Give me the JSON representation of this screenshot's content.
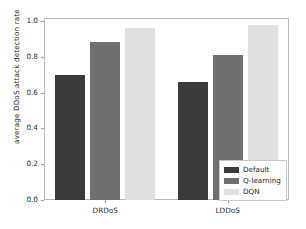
{
  "chart_data": {
    "type": "bar",
    "title": "",
    "xlabel": "",
    "ylabel": "average DDoS attack detection rate",
    "categories": [
      "DRDoS",
      "LDDoS"
    ],
    "series": [
      {
        "name": "Default",
        "values": [
          0.7,
          0.66
        ],
        "color": "#3a3a3a"
      },
      {
        "name": "Q-learning",
        "values": [
          0.88,
          0.81
        ],
        "color": "#707070"
      },
      {
        "name": "DQN",
        "values": [
          0.96,
          0.98
        ],
        "color": "#e0e0e0"
      }
    ],
    "ylim": [
      0.0,
      1.0
    ],
    "yticks": [
      "0.0",
      "0.2",
      "0.4",
      "0.6",
      "0.8",
      "1.0"
    ],
    "ytick_values": [
      0.0,
      0.2,
      0.4,
      0.6,
      0.8,
      1.0
    ],
    "grid": false,
    "legend_position": "lower right"
  },
  "legend": {
    "entries": [
      "Default",
      "Q-learning",
      "DQN"
    ]
  },
  "axes": {
    "y_label": "average DDoS attack detection rate",
    "x_ticks": [
      "DRDoS",
      "LDDoS"
    ],
    "y_ticks": [
      "0.0",
      "0.2",
      "0.4",
      "0.6",
      "0.8",
      "1.0"
    ]
  }
}
